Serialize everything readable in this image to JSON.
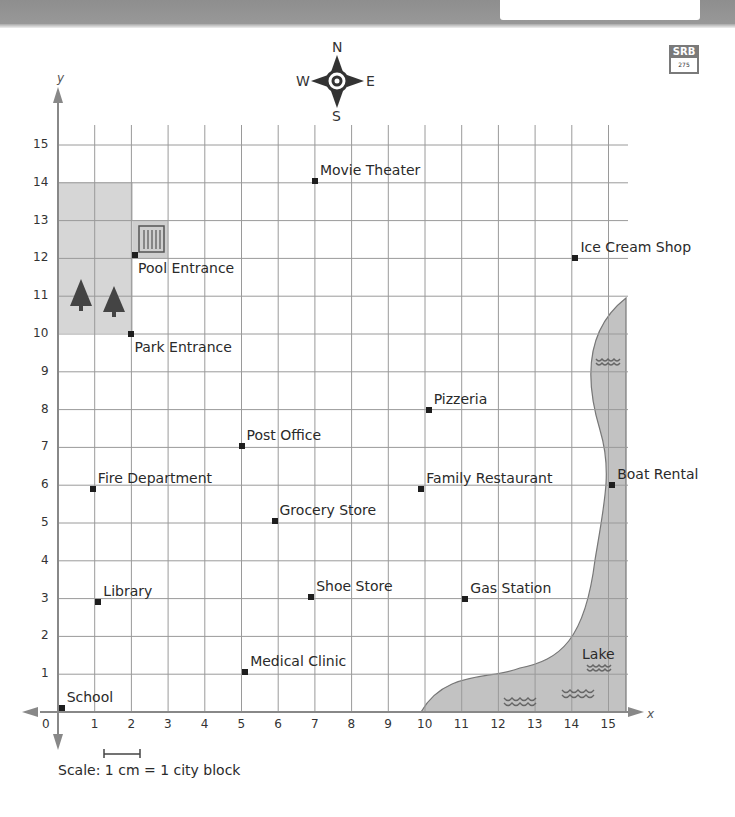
{
  "header": {
    "box_text": ""
  },
  "badge": {
    "top": "SRB",
    "bottom": "275"
  },
  "compass": {
    "north": "N",
    "south": "S",
    "east": "E",
    "west": "W"
  },
  "axes": {
    "x_label": "x",
    "y_label": "y",
    "origin_label": "0",
    "x_ticks": [
      "1",
      "2",
      "3",
      "4",
      "5",
      "6",
      "7",
      "8",
      "9",
      "10",
      "11",
      "12",
      "13",
      "14",
      "15"
    ],
    "y_ticks": [
      "1",
      "2",
      "3",
      "4",
      "5",
      "6",
      "7",
      "8",
      "9",
      "10",
      "11",
      "12",
      "13",
      "14",
      "15"
    ]
  },
  "scale": {
    "label": "Scale: 1 cm = 1 city block"
  },
  "lake": {
    "label": "Lake"
  },
  "colors": {
    "park": "#d6d6d6",
    "lake": "#c2c2c2",
    "grid": "#9a9a9a",
    "axis": "#888888",
    "point": "#1e1e1e"
  },
  "locations": [
    {
      "name": "School",
      "x": 0.1,
      "y": 0.1
    },
    {
      "name": "Medical Clinic",
      "x": 5.1,
      "y": 1.05
    },
    {
      "name": "Library",
      "x": 1.1,
      "y": 2.9
    },
    {
      "name": "Shoe Store",
      "x": 6.9,
      "y": 3.05
    },
    {
      "name": "Gas Station",
      "x": 11.1,
      "y": 3.0
    },
    {
      "name": "Grocery Store",
      "x": 5.9,
      "y": 5.05
    },
    {
      "name": "Fire Department",
      "x": 0.95,
      "y": 5.9
    },
    {
      "name": "Family Restaurant",
      "x": 9.9,
      "y": 5.9
    },
    {
      "name": "Boat Rental",
      "x": 15.1,
      "y": 6.0
    },
    {
      "name": "Post Office",
      "x": 5.0,
      "y": 7.05
    },
    {
      "name": "Pizzeria",
      "x": 10.1,
      "y": 8.0
    },
    {
      "name": "Park Entrance",
      "x": 2.0,
      "y": 10.0
    },
    {
      "name": "Pool Entrance",
      "x": 2.1,
      "y": 12.1
    },
    {
      "name": "Ice Cream Shop",
      "x": 14.1,
      "y": 12.0
    },
    {
      "name": "Movie Theater",
      "x": 7.0,
      "y": 14.05
    }
  ]
}
